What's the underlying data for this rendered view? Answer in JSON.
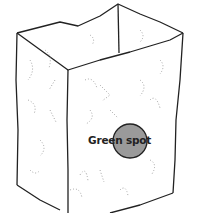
{
  "figure": {
    "label": "Green spot",
    "spot_color": "#9a9a9a",
    "line_color": "#222222"
  }
}
